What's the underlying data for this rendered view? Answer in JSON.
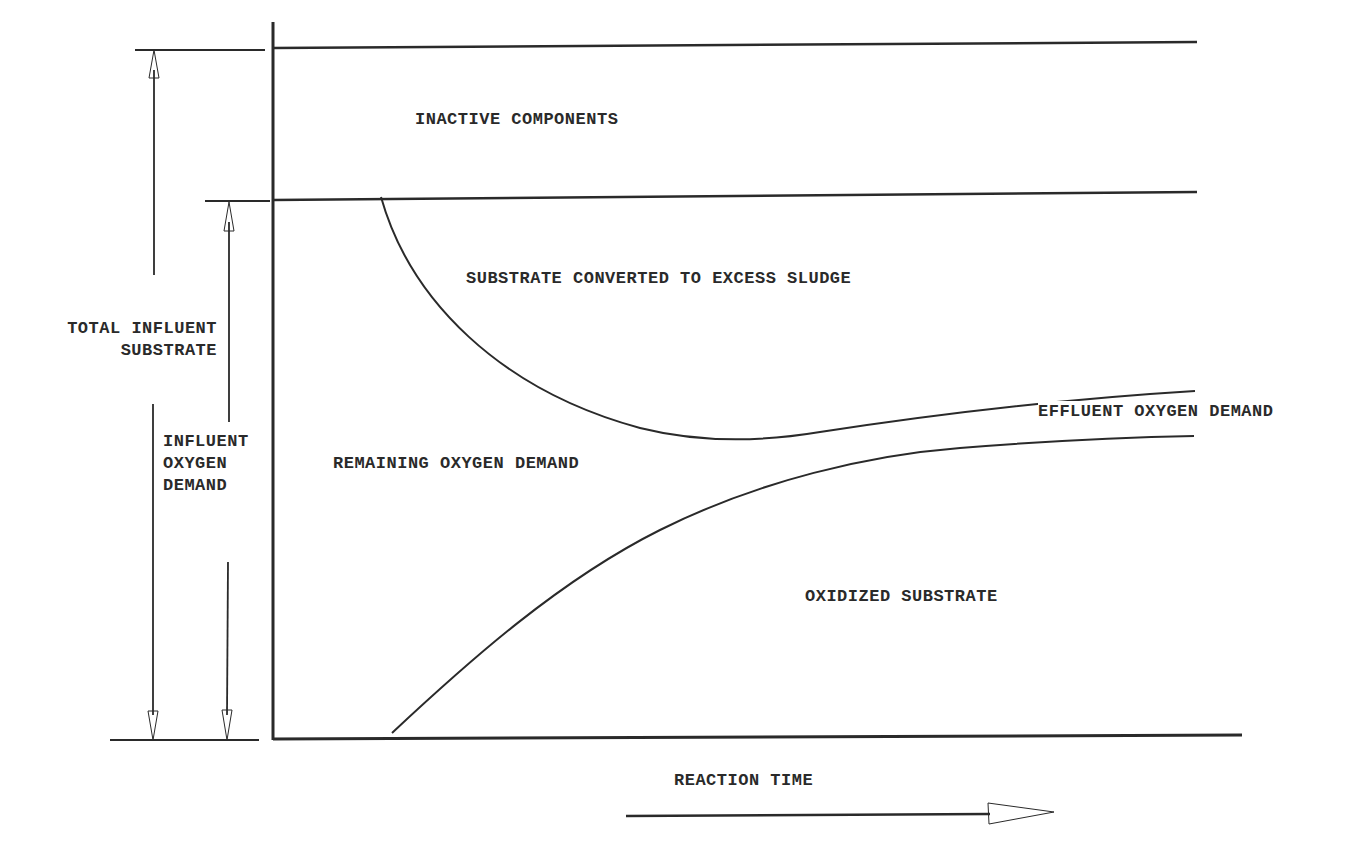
{
  "diagram": {
    "regions": {
      "inactive_components": "INACTIVE COMPONENTS",
      "substrate_converted": "SUBSTRATE CONVERTED TO EXCESS SLUDGE",
      "remaining_oxygen_demand": "REMAINING OXYGEN DEMAND",
      "effluent_oxygen_demand": "EFFLUENT OXYGEN DEMAND",
      "oxidized_substrate": "OXIDIZED SUBSTRATE"
    },
    "dimensions": {
      "total_influent_substrate": {
        "line1": "TOTAL INFLUENT",
        "line2": "SUBSTRATE"
      },
      "influent_oxygen_demand": {
        "line1": "INFLUENT",
        "line2": "OXYGEN",
        "line3": "DEMAND"
      }
    },
    "x_axis": {
      "label": "REACTION TIME"
    },
    "colors": {
      "ink": "#2a2a2a",
      "background": "#ffffff"
    }
  }
}
